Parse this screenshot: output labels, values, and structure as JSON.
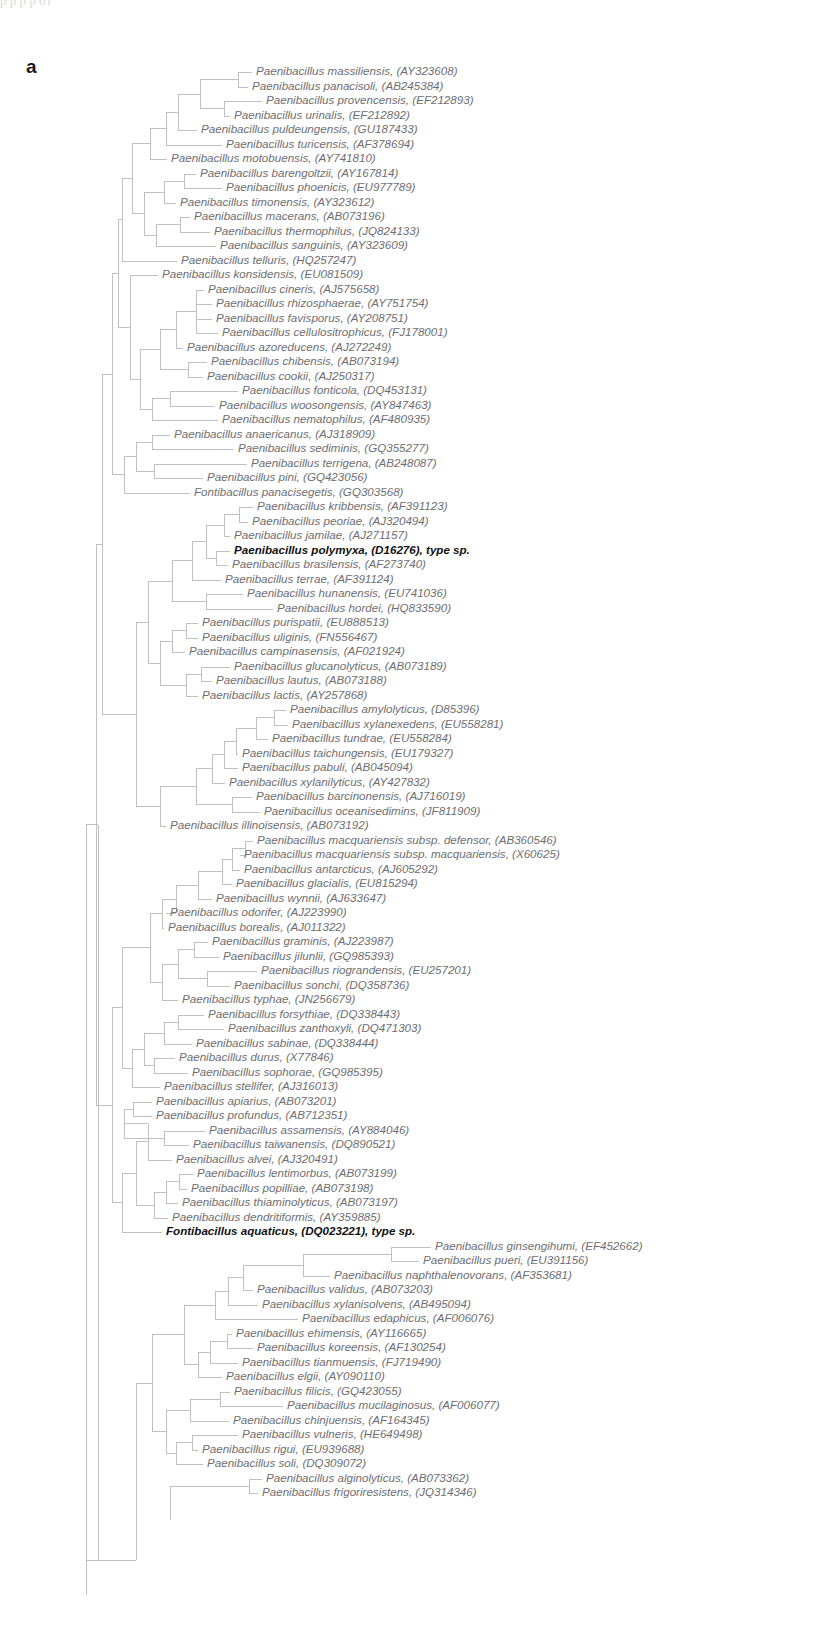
{
  "figure": {
    "panel_label": "a",
    "type": "phylogenetic-tree",
    "orientation": "left-to-right-cladogram",
    "top_edge_artifact": "p                               p    p    p                                                                          01"
  },
  "tree": {
    "leaf_count": 95,
    "line_color": "#b9b9bd",
    "label_color": "#6e6e72",
    "highlight_color": "#111111",
    "leaves": [
      {
        "i": 0,
        "y": 72,
        "x": 252,
        "label": "Paenibacillus massiliensis, (AY323608)",
        "bold": false
      },
      {
        "i": 1,
        "y": 87,
        "x": 248,
        "label": "Paenibacillus panacisoli, (AB245384)",
        "bold": false
      },
      {
        "i": 2,
        "y": 101,
        "x": 262,
        "label": "Paenibacillus provencensis, (EF212893)",
        "bold": false
      },
      {
        "i": 3,
        "y": 116,
        "x": 230,
        "label": "Paenibacillus urinalis, (EF212892)",
        "bold": false
      },
      {
        "i": 4,
        "y": 130,
        "x": 197,
        "label": "Paenibacillus puldeungensis, (GU187433)",
        "bold": false
      },
      {
        "i": 5,
        "y": 145,
        "x": 222,
        "label": "Paenibacillus turicensis, (AF378694)",
        "bold": false
      },
      {
        "i": 6,
        "y": 159,
        "x": 167,
        "label": "Paenibacillus motobuensis, (AY741810)",
        "bold": false
      },
      {
        "i": 7,
        "y": 174,
        "x": 196,
        "label": "Paenibacillus barengoltzii, (AY167814)",
        "bold": false
      },
      {
        "i": 8,
        "y": 188,
        "x": 222,
        "label": "Paenibacillus phoenicis, (EU977789)",
        "bold": false
      },
      {
        "i": 9,
        "y": 203,
        "x": 176,
        "label": "Paenibacillus timonensis, (AY323612)",
        "bold": false
      },
      {
        "i": 10,
        "y": 217,
        "x": 190,
        "label": "Paenibacillus macerans, (AB073196)",
        "bold": false
      },
      {
        "i": 11,
        "y": 232,
        "x": 210,
        "label": "Paenibacillus thermophilus, (JQ824133)",
        "bold": false
      },
      {
        "i": 12,
        "y": 246,
        "x": 216,
        "label": "Paenibacillus sanguinis, (AY323609)",
        "bold": false
      },
      {
        "i": 13,
        "y": 261,
        "x": 177,
        "label": "Paenibacillus telluris, (HQ257247)",
        "bold": false
      },
      {
        "i": 14,
        "y": 275,
        "x": 158,
        "label": "Paenibacillus konsidensis, (EU081509)",
        "bold": false
      },
      {
        "i": 15,
        "y": 290,
        "x": 204,
        "label": "Paenibacillus cineris, (AJ575658)",
        "bold": false
      },
      {
        "i": 16,
        "y": 304,
        "x": 212,
        "label": "Paenibacillus rhizosphaerae, (AY751754)",
        "bold": false
      },
      {
        "i": 17,
        "y": 319,
        "x": 212,
        "label": "Paenibacillus favisporus, (AY208751)",
        "bold": false
      },
      {
        "i": 18,
        "y": 333,
        "x": 218,
        "label": "Paenibacillus cellulositrophicus, (FJ178001)",
        "bold": false
      },
      {
        "i": 19,
        "y": 348,
        "x": 183,
        "label": "Paenibacillus azoreducens, (AJ272249)",
        "bold": false
      },
      {
        "i": 20,
        "y": 362,
        "x": 207,
        "label": "Paenibacillus chibensis, (AB073194)",
        "bold": false
      },
      {
        "i": 21,
        "y": 377,
        "x": 203,
        "label": "Paenibacillus cookii, (AJ250317)",
        "bold": false
      },
      {
        "i": 22,
        "y": 391,
        "x": 238,
        "label": "Paenibacillus fonticola, (DQ453131)",
        "bold": false
      },
      {
        "i": 23,
        "y": 406,
        "x": 215,
        "label": "Paenibacillus woosongensis, (AY847463)",
        "bold": false
      },
      {
        "i": 24,
        "y": 420,
        "x": 218,
        "label": "Paenibacillus nematophilus, (AF480935)",
        "bold": false
      },
      {
        "i": 25,
        "y": 435,
        "x": 170,
        "label": "Paenibacillus anaericanus, (AJ318909)",
        "bold": false
      },
      {
        "i": 26,
        "y": 449,
        "x": 234,
        "label": "Paenibacillus sediminis, (GQ355277)",
        "bold": false
      },
      {
        "i": 27,
        "y": 464,
        "x": 247,
        "label": "Paenibacillus terrigena, (AB248087)",
        "bold": false
      },
      {
        "i": 28,
        "y": 478,
        "x": 203,
        "label": "Paenibacillus pini, (GQ423056)",
        "bold": false
      },
      {
        "i": 29,
        "y": 493,
        "x": 190,
        "label": "Fontibacillus panacisegetis, (GQ303568)",
        "bold": false
      },
      {
        "i": 30,
        "y": 507,
        "x": 253,
        "label": "Paenibacillus kribbensis, (AF391123)",
        "bold": false
      },
      {
        "i": 31,
        "y": 522,
        "x": 248,
        "label": "Paenibacillus peoriae, (AJ320494)",
        "bold": false
      },
      {
        "i": 32,
        "y": 536,
        "x": 230,
        "label": "Paenibacillus jamilae, (AJ271157)",
        "bold": false
      },
      {
        "i": 33,
        "y": 551,
        "x": 230,
        "label": "Paenibacillus polymyxa, (D16276), type sp.",
        "bold": true
      },
      {
        "i": 34,
        "y": 565,
        "x": 228,
        "label": "Paenibacillus brasilensis, (AF273740)",
        "bold": false
      },
      {
        "i": 35,
        "y": 580,
        "x": 221,
        "label": "Paenibacillus terrae, (AF391124)",
        "bold": false
      },
      {
        "i": 36,
        "y": 594,
        "x": 243,
        "label": "Paenibacillus hunanensis, (EU741036)",
        "bold": false
      },
      {
        "i": 37,
        "y": 609,
        "x": 273,
        "label": "Paenibacillus hordei, (HQ833590)",
        "bold": false
      },
      {
        "i": 38,
        "y": 623,
        "x": 198,
        "label": "Paenibacillus purispatii, (EU888513)",
        "bold": false
      },
      {
        "i": 39,
        "y": 638,
        "x": 198,
        "label": "Paenibacillus uliginis, (FN556467)",
        "bold": false
      },
      {
        "i": 40,
        "y": 652,
        "x": 185,
        "label": "Paenibacillus campinasensis, (AF021924)",
        "bold": false
      },
      {
        "i": 41,
        "y": 667,
        "x": 230,
        "label": "Paenibacillus glucanolyticus, (AB073189)",
        "bold": false
      },
      {
        "i": 42,
        "y": 681,
        "x": 212,
        "label": "Paenibacillus lautus, (AB073188)",
        "bold": false
      },
      {
        "i": 43,
        "y": 696,
        "x": 198,
        "label": "Paenibacillus lactis, (AY257868)",
        "bold": false
      },
      {
        "i": 44,
        "y": 710,
        "x": 286,
        "label": "Paenibacillus amylolyticus, (D85396)",
        "bold": false
      },
      {
        "i": 45,
        "y": 725,
        "x": 288,
        "label": "Paenibacillus xylanexedens, (EU558281)",
        "bold": false
      },
      {
        "i": 46,
        "y": 739,
        "x": 268,
        "label": "Paenibacillus tundrae, (EU558284)",
        "bold": false
      },
      {
        "i": 47,
        "y": 754,
        "x": 238,
        "label": "Paenibacillus taichungensis, (EU179327)",
        "bold": false
      },
      {
        "i": 48,
        "y": 768,
        "x": 238,
        "label": "Paenibacillus pabuli, (AB045094)",
        "bold": false
      },
      {
        "i": 49,
        "y": 783,
        "x": 225,
        "label": "Paenibacillus xylanilyticus, (AY427832)",
        "bold": false
      },
      {
        "i": 50,
        "y": 797,
        "x": 252,
        "label": "Paenibacillus barcinonensis, (AJ716019)",
        "bold": false
      },
      {
        "i": 51,
        "y": 812,
        "x": 260,
        "label": "Paenibacillus oceanisedimins, (JF811909)",
        "bold": false
      },
      {
        "i": 52,
        "y": 826,
        "x": 166,
        "label": "Paenibacillus illinoisensis, (AB073192)",
        "bold": false
      },
      {
        "i": 53,
        "y": 841,
        "x": 253,
        "label": "Paenibacillus macquariensis subsp. defensor, (AB360546)",
        "bold": false
      },
      {
        "i": 54,
        "y": 855,
        "x": 240,
        "label": "Paenibacillus macquariensis subsp. macquariensis, (X60625)",
        "bold": false
      },
      {
        "i": 55,
        "y": 870,
        "x": 240,
        "label": "Paenibacillus antarcticus, (AJ605292)",
        "bold": false
      },
      {
        "i": 56,
        "y": 884,
        "x": 232,
        "label": "Paenibacillus glacialis, (EU815294)",
        "bold": false
      },
      {
        "i": 57,
        "y": 899,
        "x": 212,
        "label": "Paenibacillus wynnii, (AJ633647)",
        "bold": false
      },
      {
        "i": 58,
        "y": 913,
        "x": 166,
        "label": "Paenibacillus odorifer, (AJ223990)",
        "bold": false
      },
      {
        "i": 59,
        "y": 928,
        "x": 164,
        "label": "Paenibacillus borealis, (AJ011322)",
        "bold": false
      },
      {
        "i": 60,
        "y": 942,
        "x": 208,
        "label": "Paenibacillus graminis, (AJ223987)",
        "bold": false
      },
      {
        "i": 61,
        "y": 957,
        "x": 219,
        "label": "Paenibacillus jilunlii, (GQ985393)",
        "bold": false
      },
      {
        "i": 62,
        "y": 971,
        "x": 257,
        "label": "Paenibacillus riograndensis, (EU257201)",
        "bold": false
      },
      {
        "i": 63,
        "y": 986,
        "x": 230,
        "label": "Paenibacillus sonchi, (DQ358736)",
        "bold": false
      },
      {
        "i": 64,
        "y": 1000,
        "x": 178,
        "label": "Paenibacillus typhae, (JN256679)",
        "bold": false
      },
      {
        "i": 65,
        "y": 1015,
        "x": 204,
        "label": "Paenibacillus forsythiae, (DQ338443)",
        "bold": false
      },
      {
        "i": 66,
        "y": 1029,
        "x": 224,
        "label": "Paenibacillus zanthoxyli, (DQ471303)",
        "bold": false
      },
      {
        "i": 67,
        "y": 1044,
        "x": 192,
        "label": "Paenibacillus sabinae, (DQ338444)",
        "bold": false
      },
      {
        "i": 68,
        "y": 1058,
        "x": 175,
        "label": "Paenibacillus durus, (X77846)",
        "bold": false
      },
      {
        "i": 69,
        "y": 1073,
        "x": 188,
        "label": "Paenibacillus sophorae, (GQ985395)",
        "bold": false
      },
      {
        "i": 70,
        "y": 1087,
        "x": 160,
        "label": "Paenibacillus stellifer, (AJ316013)",
        "bold": false
      },
      {
        "i": 71,
        "y": 1102,
        "x": 152,
        "label": "Paenibacillus apiarius, (AB073201)",
        "bold": false
      },
      {
        "i": 72,
        "y": 1116,
        "x": 152,
        "label": "Paenibacillus profundus, (AB712351)",
        "bold": false
      },
      {
        "i": 73,
        "y": 1131,
        "x": 205,
        "label": "Paenibacillus assamensis, (AY884046)",
        "bold": false
      },
      {
        "i": 74,
        "y": 1145,
        "x": 189,
        "label": "Paenibacillus taiwanensis, (DQ890521)",
        "bold": false
      },
      {
        "i": 75,
        "y": 1160,
        "x": 172,
        "label": "Paenibacillus alvei, (AJ320491)",
        "bold": false
      },
      {
        "i": 76,
        "y": 1174,
        "x": 193,
        "label": "Paenibacillus lentimorbus, (AB073199)",
        "bold": false
      },
      {
        "i": 77,
        "y": 1189,
        "x": 187,
        "label": "Paenibacillus popilliae, (AB073198)",
        "bold": false
      },
      {
        "i": 78,
        "y": 1203,
        "x": 178,
        "label": "Paenibacillus thiaminolyticus, (AB073197)",
        "bold": false
      },
      {
        "i": 79,
        "y": 1218,
        "x": 168,
        "label": "Paenibacillus dendritiformis, (AY359885)",
        "bold": false
      },
      {
        "i": 80,
        "y": 1232,
        "x": 162,
        "label": "Fontibacillus aquaticus, (DQ023221), type sp.",
        "bold": true
      },
      {
        "i": 81,
        "y": 1247,
        "x": 431,
        "label": "Paenibacillus ginsengihumi, (EF452662)",
        "bold": false
      },
      {
        "i": 82,
        "y": 1261,
        "x": 419,
        "label": "Paenibacillus pueri, (EU391156)",
        "bold": false
      },
      {
        "i": 83,
        "y": 1276,
        "x": 330,
        "label": "Paenibacillus naphthalenovorans, (AF353681)",
        "bold": false
      },
      {
        "i": 84,
        "y": 1290,
        "x": 253,
        "label": "Paenibacillus validus, (AB073203)",
        "bold": false
      },
      {
        "i": 85,
        "y": 1305,
        "x": 258,
        "label": "Paenibacillus xylanisolvens, (AB495094)",
        "bold": false
      },
      {
        "i": 86,
        "y": 1319,
        "x": 298,
        "label": "Paenibacillus edaphicus, (AF006076)",
        "bold": false
      },
      {
        "i": 87,
        "y": 1334,
        "x": 232,
        "label": "Paenibacillus ehimensis, (AY116665)",
        "bold": false
      },
      {
        "i": 88,
        "y": 1348,
        "x": 253,
        "label": "Paenibacillus koreensis, (AF130254)",
        "bold": false
      },
      {
        "i": 89,
        "y": 1363,
        "x": 238,
        "label": "Paenibacillus tianmuensis, (FJ719490)",
        "bold": false
      },
      {
        "i": 90,
        "y": 1377,
        "x": 222,
        "label": "Paenibacillus elgii, (AY090110)",
        "bold": false
      },
      {
        "i": 91,
        "y": 1392,
        "x": 230,
        "label": "Paenibacillus filicis, (GQ423055)",
        "bold": false
      },
      {
        "i": 92,
        "y": 1406,
        "x": 283,
        "label": "Paenibacillus mucilaginosus, (AF006077)",
        "bold": false
      },
      {
        "i": 93,
        "y": 1421,
        "x": 229,
        "label": "Paenibacillus chinjuensis, (AF164345)",
        "bold": false
      },
      {
        "i": 94,
        "y": 1435,
        "x": 238,
        "label": "Paenibacillus vulneris, (HE649498)",
        "bold": false
      },
      {
        "i": 95,
        "y": 1450,
        "x": 198,
        "label": "Paenibacillus rigui, (EU939688)",
        "bold": false
      },
      {
        "i": 96,
        "y": 1464,
        "x": 203,
        "label": "Paenibacillus soli, (DQ309072)",
        "bold": false
      },
      {
        "i": 97,
        "y": 1479,
        "x": 262,
        "label": "Paenibacillus alginolyticus, (AB073362)",
        "bold": false
      },
      {
        "i": 98,
        "y": 1493,
        "x": 258,
        "label": "Paenibacillus frigoriresistens, (JQ314346)",
        "bold": false
      }
    ],
    "nodes": [
      {
        "id": "n_mass_pana",
        "x": 238,
        "children_y": [
          72,
          87
        ]
      },
      {
        "id": "n_prov_urin",
        "x": 224,
        "children_y": [
          101,
          116
        ]
      },
      {
        "id": "n_mp_pu",
        "x": 200,
        "children_x": [
          238,
          224
        ]
      },
      {
        "id": "n_puld",
        "x": 178,
        "children_y": [
          130
        ]
      },
      {
        "id": "n_turi",
        "x": 168,
        "children_y": [
          145
        ]
      },
      {
        "id": "n_baren_phoe",
        "x": 182,
        "children_y": [
          174,
          188
        ]
      },
      {
        "id": "n_timo",
        "x": 158,
        "children_y": [
          203
        ]
      },
      {
        "id": "n_mace_ther",
        "x": 178,
        "children_y": [
          217,
          232
        ]
      },
      {
        "id": "n_sang",
        "x": 147,
        "children_y": [
          246
        ]
      },
      {
        "id": "n_clade_A",
        "x": 137,
        "children_y": [
          261
        ]
      },
      {
        "id": "n_cine_rhiz_favi_cell",
        "x": 196,
        "children_y": [
          290,
          304,
          319,
          333
        ]
      },
      {
        "id": "n_chib_cook",
        "x": 186,
        "children_y": [
          362,
          377
        ]
      },
      {
        "id": "n_font_woos",
        "x": 168,
        "children_y": [
          391,
          406
        ]
      },
      {
        "id": "n_anae_sedi",
        "x": 150,
        "children_y": [
          435,
          449
        ]
      },
      {
        "id": "n_terr_pini",
        "x": 152,
        "children_y": [
          464,
          478
        ]
      },
      {
        "id": "n_krib_peor",
        "x": 239,
        "children_y": [
          507,
          522
        ]
      },
      {
        "id": "n_huna_hord",
        "x": 205,
        "children_y": [
          594,
          609
        ]
      },
      {
        "id": "n_puri_ulig",
        "x": 186,
        "children_y": [
          623,
          638
        ]
      },
      {
        "id": "n_gluc_laut",
        "x": 201,
        "children_y": [
          667,
          681
        ]
      },
      {
        "id": "n_amyl_xyla",
        "x": 274,
        "children_y": [
          710,
          725
        ]
      },
      {
        "id": "n_barc_ocea",
        "x": 230,
        "children_y": [
          797,
          812
        ]
      },
      {
        "id": "n_macq2",
        "x": 243,
        "children_y": [
          841,
          855
        ]
      },
      {
        "id": "n_gram_jilu",
        "x": 192,
        "children_y": [
          942,
          957
        ]
      },
      {
        "id": "n_riog_sonc",
        "x": 205,
        "children_y": [
          971,
          986
        ]
      },
      {
        "id": "n_fors_zant",
        "x": 178,
        "children_y": [
          1015,
          1029
        ]
      },
      {
        "id": "n_duru_soph",
        "x": 152,
        "children_y": [
          1058,
          1073
        ]
      },
      {
        "id": "n_apia_prof",
        "x": 131,
        "children_y": [
          1102,
          1116
        ]
      },
      {
        "id": "n_assa_taiw",
        "x": 162,
        "children_y": [
          1131,
          1145
        ]
      },
      {
        "id": "n_lent_popi",
        "x": 177,
        "children_y": [
          1174,
          1189
        ]
      },
      {
        "id": "n_gins_puer",
        "x": 391,
        "children_y": [
          1247,
          1261
        ]
      },
      {
        "id": "n_ehim_kore",
        "x": 225,
        "children_y": [
          1334,
          1348
        ]
      },
      {
        "id": "n_fili_muci",
        "x": 218,
        "children_y": [
          1392,
          1406
        ]
      },
      {
        "id": "n_vuln_rigu",
        "x": 190,
        "children_y": [
          1435,
          1450
        ]
      },
      {
        "id": "n_algi_frig",
        "x": 249,
        "children_y": [
          1479,
          1493
        ]
      }
    ],
    "root_depth_x": 98
  }
}
